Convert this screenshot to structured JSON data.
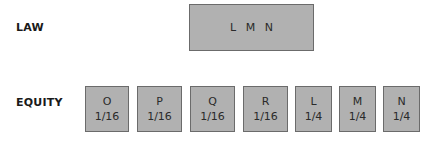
{
  "law": {
    "label": "LAW",
    "box": {
      "text": "L M N"
    }
  },
  "equity": {
    "label": "EQUITY",
    "boxes": [
      {
        "name": "O",
        "share": "1/16"
      },
      {
        "name": "P",
        "share": "1/16"
      },
      {
        "name": "Q",
        "share": "1/16"
      },
      {
        "name": "R",
        "share": "1/16"
      },
      {
        "name": "L",
        "share": "1/4"
      },
      {
        "name": "M",
        "share": "1/4"
      },
      {
        "name": "N",
        "share": "1/4"
      }
    ]
  },
  "colors": {
    "box_fill": "#b1b1b1",
    "box_border": "#6b6b6b",
    "text": "#2a2a2a"
  }
}
